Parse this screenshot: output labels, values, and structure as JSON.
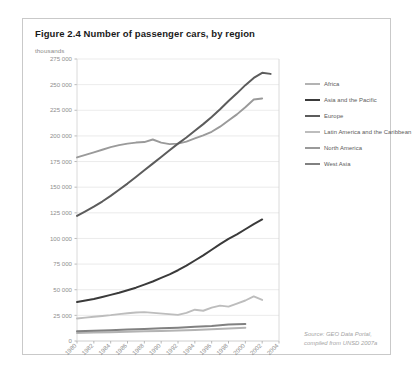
{
  "figure": {
    "title": "Figure 2.4 Number of passenger cars, by region",
    "source_line_1": "Source: GEO Data Portal,",
    "source_line_2": "compiled from UNSD 2007a"
  },
  "legend": {
    "items": [
      {
        "label": "Africa",
        "color": "#b3b3b3"
      },
      {
        "label": "Asia and the Pacific",
        "color": "#3a3a3a"
      },
      {
        "label": "Europe",
        "color": "#5c5c5c"
      },
      {
        "label": "Latin America and the Caribbean",
        "color": "#bdbdbd"
      },
      {
        "label": "North America",
        "color": "#9a9a9a"
      },
      {
        "label": "West Asia",
        "color": "#818181"
      }
    ]
  },
  "chart_data": {
    "type": "line",
    "title": "Figure 2.4 Number of passenger cars, by region",
    "xlabel": "",
    "ylabel": "thousands",
    "ylim": [
      0,
      275000
    ],
    "ytick_step": 25000,
    "grid": true,
    "legend_position": "right",
    "ytick_labels": [
      "275 000",
      "250 000",
      "225 000",
      "200 000",
      "175 000",
      "150 000",
      "125 000",
      "100 000",
      "75 000",
      "50 000",
      "25 000",
      "0"
    ],
    "ytick_values": [
      275000,
      250000,
      225000,
      200000,
      175000,
      150000,
      125000,
      100000,
      75000,
      50000,
      25000,
      0
    ],
    "xtick_labels": [
      "1980",
      "1982",
      "1984",
      "1986",
      "1988",
      "1990",
      "1992",
      "1994",
      "1996",
      "1998",
      "2000",
      "2002",
      "2004"
    ],
    "x": [
      1980,
      1982,
      1984,
      1986,
      1988,
      1990,
      1992,
      1994,
      1996,
      1998,
      2000,
      2002,
      2004
    ],
    "xlim": [
      1980,
      2004
    ],
    "series": [
      {
        "name": "North America",
        "color": "#9a9a9a",
        "x": [
          1980,
          1981,
          1982,
          1983,
          1984,
          1985,
          1986,
          1987,
          1988,
          1989,
          1990,
          1991,
          1992,
          1993,
          1994,
          1995,
          1996,
          1997,
          1998,
          1999,
          2000,
          2001,
          2002
        ],
        "values": [
          179000,
          181500,
          184000,
          186500,
          189000,
          191000,
          192500,
          193500,
          194000,
          196500,
          193500,
          192000,
          192500,
          194500,
          197500,
          200500,
          204000,
          209000,
          215000,
          221000,
          228000,
          235500,
          236500
        ]
      },
      {
        "name": "Europe",
        "color": "#5c5c5c",
        "x": [
          1980,
          1981,
          1982,
          1983,
          1984,
          1985,
          1986,
          1987,
          1988,
          1989,
          1990,
          1991,
          1992,
          1993,
          1994,
          1995,
          1996,
          1997,
          1998,
          1999,
          2000,
          2001,
          2002,
          2003
        ],
        "values": [
          122000,
          126500,
          131000,
          136000,
          141500,
          147500,
          153500,
          160000,
          166500,
          173000,
          179500,
          186000,
          192500,
          198500,
          205000,
          211500,
          218500,
          226000,
          234000,
          241500,
          249500,
          256500,
          261500,
          260500
        ]
      },
      {
        "name": "Asia and the Pacific",
        "color": "#3a3a3a",
        "x": [
          1980,
          1981,
          1982,
          1983,
          1984,
          1985,
          1986,
          1987,
          1988,
          1989,
          1990,
          1991,
          1992,
          1993,
          1994,
          1995,
          1996,
          1997,
          1998,
          1999,
          2000,
          2001,
          2002
        ],
        "values": [
          38000,
          39500,
          41000,
          43000,
          45000,
          47000,
          49500,
          52000,
          55000,
          58000,
          61500,
          65000,
          69000,
          73500,
          78500,
          83500,
          89000,
          94500,
          99500,
          104000,
          109000,
          114000,
          118500
        ]
      },
      {
        "name": "Latin America and the Caribbean",
        "color": "#bdbdbd",
        "x": [
          1980,
          1981,
          1982,
          1983,
          1984,
          1985,
          1986,
          1987,
          1988,
          1992,
          1993,
          1994,
          1995,
          1996,
          1997,
          1998,
          1999,
          2000,
          2001,
          2002
        ],
        "values": [
          22000,
          22800,
          23600,
          24400,
          25200,
          26200,
          27000,
          27800,
          28200,
          25500,
          27500,
          30500,
          29500,
          32500,
          34500,
          33500,
          36500,
          39500,
          43500,
          40000
        ]
      },
      {
        "name": "West Asia",
        "color": "#818181",
        "x": [
          1980,
          1982,
          1984,
          1986,
          1988,
          1990,
          1992,
          1994,
          1996,
          1998,
          2000
        ],
        "values": [
          9500,
          10000,
          10600,
          11200,
          11800,
          12400,
          13000,
          13800,
          14600,
          16000,
          16500
        ]
      },
      {
        "name": "Africa",
        "color": "#b3b3b3",
        "x": [
          1980,
          1982,
          1984,
          1986,
          1988,
          1990,
          1992,
          1994,
          1996,
          1998,
          2000
        ],
        "values": [
          7800,
          8200,
          8600,
          9000,
          9400,
          9800,
          10200,
          10800,
          11400,
          12200,
          12800
        ]
      }
    ]
  }
}
